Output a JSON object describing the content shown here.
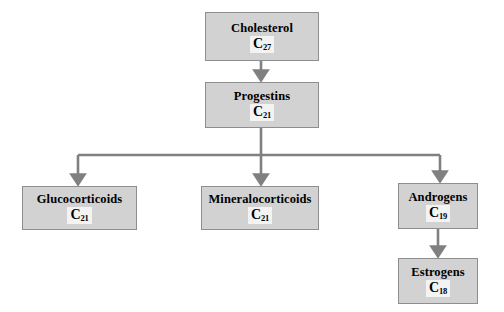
{
  "diagram": {
    "type": "flowchart",
    "orientation": "top-down",
    "theme": {
      "node_fill": "#d2d2d2",
      "node_border": "#8e8e8e",
      "connector": "#808080",
      "formula_backing": "#f3f3f3",
      "text": "#000000",
      "background": "#ffffff"
    },
    "nodes": [
      {
        "id": "cholesterol",
        "label": "Cholesterol",
        "formula_element": "C",
        "formula_subscript": "27"
      },
      {
        "id": "progestins",
        "label": "Progestins",
        "formula_element": "C",
        "formula_subscript": "21"
      },
      {
        "id": "glucocorticoids",
        "label": "Glucocorticoids",
        "formula_element": "C",
        "formula_subscript": "21"
      },
      {
        "id": "mineralocorticoids",
        "label": "Mineralocorticoids",
        "formula_element": "C",
        "formula_subscript": "21"
      },
      {
        "id": "androgens",
        "label": "Androgens",
        "formula_element": "C",
        "formula_subscript": "19"
      },
      {
        "id": "estrogens",
        "label": "Estrogens",
        "formula_element": "C",
        "formula_subscript": "18"
      }
    ],
    "edges": [
      {
        "from": "cholesterol",
        "to": "progestins",
        "style": "straight-arrow"
      },
      {
        "from": "progestins",
        "to": "glucocorticoids",
        "style": "elbow-arrow"
      },
      {
        "from": "progestins",
        "to": "mineralocorticoids",
        "style": "straight-arrow"
      },
      {
        "from": "progestins",
        "to": "androgens",
        "style": "elbow-arrow"
      },
      {
        "from": "androgens",
        "to": "estrogens",
        "style": "straight-arrow"
      }
    ]
  }
}
